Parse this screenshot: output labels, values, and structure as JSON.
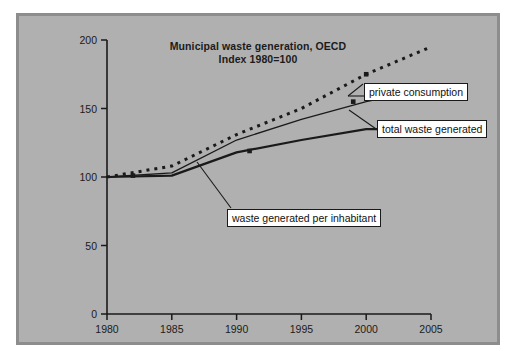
{
  "figure": {
    "background_color": "#ffffff",
    "panel_color": "#b0b0b0",
    "panel_border_color": "#8d8d8d",
    "axis_color": "#1a1a1a"
  },
  "title": {
    "line1": "Municipal waste generation, OECD",
    "line2": "Index 1980=100"
  },
  "annotations": {
    "private_consumption": "private consumption",
    "total_waste_generated": "total waste generated",
    "waste_per_inhabitant": "waste generated per inhabitant"
  },
  "axes": {
    "y_ticks": [
      "0",
      "50",
      "100",
      "150",
      "200"
    ],
    "x_ticks": [
      "1980",
      "1985",
      "1990",
      "1995",
      "2000",
      "2005"
    ]
  },
  "chart_data": {
    "type": "line",
    "subtitle": "Index 1980=100",
    "xlabel": "",
    "ylabel": "",
    "xlim": [
      1980,
      2005
    ],
    "ylim": [
      0,
      200
    ],
    "grid": false,
    "legend_position": "inline-annotations",
    "x": [
      1980,
      1985,
      1990,
      1995,
      2000,
      2005
    ],
    "series": [
      {
        "name": "private consumption",
        "style": "dotted",
        "color": "#1a1a1a",
        "values": [
          100,
          108,
          131,
          150,
          175,
          195
        ]
      },
      {
        "name": "total waste generated",
        "style": "solid-thin",
        "color": "#1a1a1a",
        "values": [
          100,
          103,
          127,
          142,
          155,
          165
        ]
      },
      {
        "name": "waste generated per inhabitant",
        "style": "solid-thick",
        "color": "#1a1a1a",
        "values": [
          100,
          101,
          118,
          127,
          135,
          135
        ]
      }
    ],
    "markers": [
      {
        "series": "private consumption",
        "x": 2000,
        "y": 175
      },
      {
        "series": "total waste generated",
        "x": 1999,
        "y": 155
      },
      {
        "series": "waste generated per inhabitant",
        "x": 1991,
        "y": 119
      },
      {
        "series": "waste generated per inhabitant",
        "x": 1982,
        "y": 101
      }
    ]
  }
}
